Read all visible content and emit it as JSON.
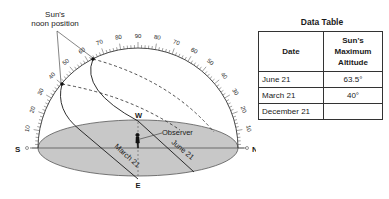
{
  "diagram": {
    "callout_label_line1": "Sun's",
    "callout_label_line2": "noon position",
    "arc_labels_left": [
      "10",
      "20",
      "30",
      "40",
      "50",
      "60",
      "70",
      "80"
    ],
    "arc_label_top": "90",
    "arc_labels_right": [
      "80",
      "70",
      "60",
      "50",
      "40",
      "30",
      "20",
      "10"
    ],
    "directions": {
      "south": "S",
      "north": "N",
      "west": "W",
      "east": "E"
    },
    "observer_label": "Observer",
    "path_labels": {
      "june": "June 21",
      "march": "March 21"
    },
    "colors": {
      "ground": "#c8c8c8",
      "line": "#1a1a1a",
      "ground_edge": "#555555"
    }
  },
  "data_table": {
    "title": "Data Table",
    "headers": [
      "Date",
      "Sun's Maximum Altitude"
    ],
    "header_altitude_lines": [
      "Sun's",
      "Maximum",
      "Altitude"
    ],
    "rows": [
      {
        "date": "June 21",
        "altitude": "63.5°"
      },
      {
        "date": "March 21",
        "altitude": "40°"
      },
      {
        "date": "December 21",
        "altitude": ""
      }
    ]
  }
}
